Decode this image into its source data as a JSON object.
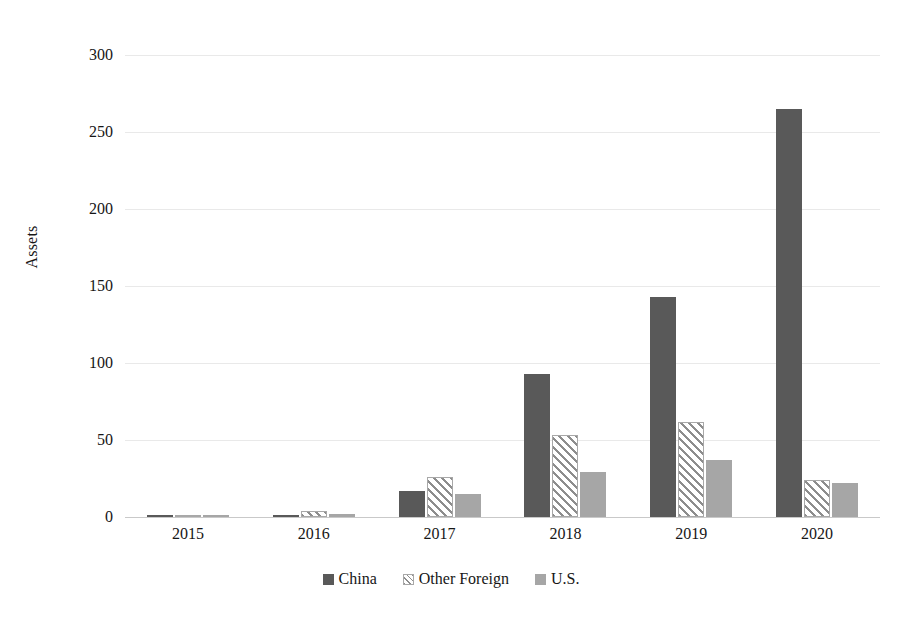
{
  "chart_data": {
    "type": "bar",
    "title": "",
    "subtitle": "",
    "xlabel": "",
    "ylabel": "Assets",
    "categories": [
      "2015",
      "2016",
      "2017",
      "2018",
      "2019",
      "2020"
    ],
    "series": [
      {
        "name": "China",
        "values": [
          1,
          1,
          17,
          93,
          143,
          265
        ],
        "color": "#595959",
        "fill": "solid"
      },
      {
        "name": "Other Foreign",
        "values": [
          0,
          4,
          26,
          53,
          62,
          24
        ],
        "color": "#8d8d8d",
        "fill": "diagonal-hatch"
      },
      {
        "name": "U.S.",
        "values": [
          1,
          2,
          15,
          29,
          37,
          22
        ],
        "color": "#a6a6a6",
        "fill": "solid"
      }
    ],
    "ylim": [
      0,
      300
    ],
    "yticks": [
      0,
      50,
      100,
      150,
      200,
      250,
      300
    ],
    "ytick_labels": [
      "0",
      "50",
      "100",
      "150",
      "200",
      "250",
      "300"
    ],
    "grid": true,
    "grid_axis": "y",
    "legend_position": "bottom-center",
    "legend_entries": [
      "China",
      "Other Foreign",
      "U.S."
    ]
  },
  "axis": {
    "y_title": "Assets"
  }
}
